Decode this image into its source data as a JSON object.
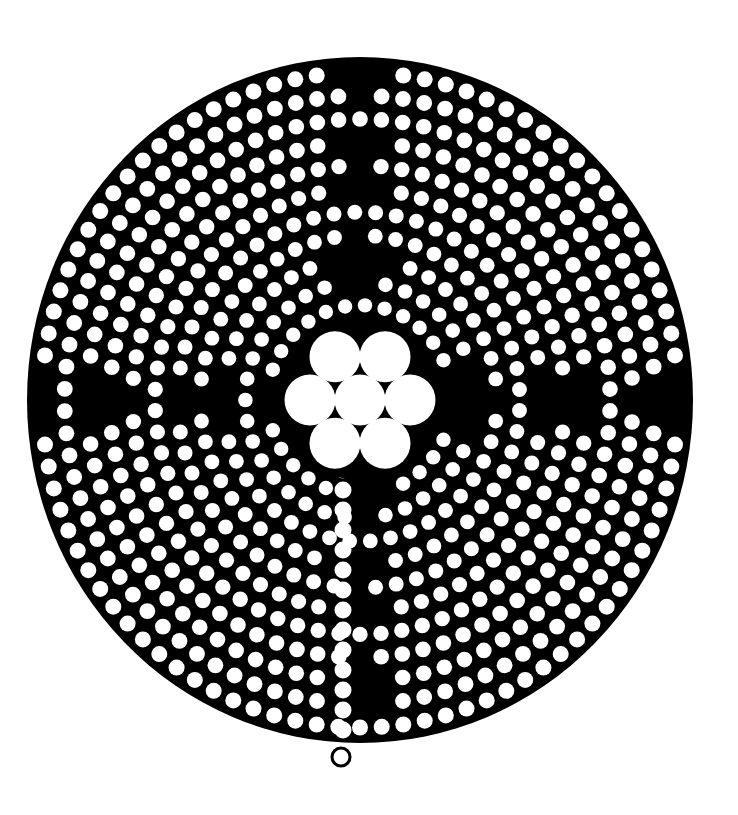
{
  "diagram": {
    "style": "white dots on black disc",
    "colors": {
      "background": "#ffffff",
      "disc": "#000000",
      "dot": "#ffffff"
    },
    "rings": 11,
    "rosette_petals": 6,
    "has_center_circle": true,
    "entrance": "bottom",
    "cross_arms": [
      "top",
      "left",
      "right",
      "bottom"
    ]
  }
}
